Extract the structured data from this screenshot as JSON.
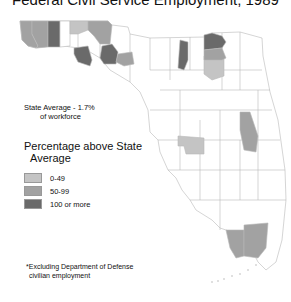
{
  "title": "Federal Civil Service Employment, 1989",
  "state_average": {
    "line1": "State Average - 1.7%",
    "line2": "of workforce"
  },
  "legend": {
    "title_line1": "Percentage above State",
    "title_line2": "Average",
    "items": [
      {
        "label": "0-49",
        "color": "#c4c4c4"
      },
      {
        "label": "50-99",
        "color": "#a2a2a2"
      },
      {
        "label": "100 or more",
        "color": "#6a6a6a"
      }
    ]
  },
  "footnote": {
    "line1": "*Excluding Department of Defense",
    "line2": "civilian employment"
  },
  "colors": {
    "base": "#ffffff",
    "border": "#b8b8b8",
    "light": "#c4c4c4",
    "medium": "#a2a2a2",
    "dark": "#6a6a6a"
  }
}
